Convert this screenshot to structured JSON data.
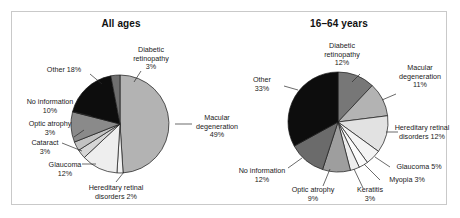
{
  "figure": {
    "border_color": "#c9c9c9",
    "background": "#ffffff"
  },
  "charts": [
    {
      "id": "all-ages",
      "title": "All ages",
      "center": [
        108,
        112
      ],
      "radius": 49,
      "start_angle": -90,
      "chart_data": {
        "type": "pie",
        "title": "All ages",
        "xlabel": "",
        "ylabel": "",
        "legend": "none",
        "grid": false,
        "categories": [
          "Macular degeneration",
          "Hereditary retinal disorders",
          "Glaucoma",
          "Cataract",
          "Optic atrophy",
          "No information",
          "Other",
          "Diabetic retinopathy"
        ],
        "values": [
          49,
          2,
          12,
          3,
          3,
          10,
          18,
          3
        ],
        "units": "percent",
        "colors": [
          "#b3b3b3",
          "#f2f2f2",
          "#eeeeee",
          "#d6d6d6",
          "#c2c2c2",
          "#8a8a8a",
          "#0d0d0d",
          "#6e6e6e"
        ],
        "labels": [
          {
            "text": "Macular",
            "text2": "degeneration",
            "text3": "49%",
            "x": 205,
            "y": 108,
            "anchor": "middle",
            "leader": [
              [
                163,
                112
              ],
              [
                180,
                112
              ]
            ]
          },
          {
            "text": "Hereditary retinal",
            "text2": "disorders 2%",
            "text3": "",
            "x": 104,
            "y": 178,
            "anchor": "middle",
            "leader": [
              [
                112,
                160
              ],
              [
                104,
                170
              ]
            ]
          },
          {
            "text": "Glaucoma",
            "text2": "12%",
            "text3": "",
            "x": 53,
            "y": 155,
            "anchor": "middle",
            "leader": [
              [
                84,
                152
              ],
              [
                70,
                152
              ]
            ]
          },
          {
            "text": "Cataract",
            "text2": "3%",
            "text3": "",
            "x": 33,
            "y": 133,
            "anchor": "middle",
            "leader": [
              [
                70,
                139
              ],
              [
                50,
                131
              ]
            ]
          },
          {
            "text": "Optic atrophy",
            "text2": "3%",
            "text3": "",
            "x": 38,
            "y": 114,
            "anchor": "middle",
            "leader": [
              [
                62,
                125
              ],
              [
                72,
                118
              ]
            ]
          },
          {
            "text": "No information",
            "text2": "10%",
            "text3": "",
            "x": 38,
            "y": 92,
            "anchor": "middle",
            "leader": [
              [
                62,
                100
              ],
              [
                79,
                104
              ]
            ]
          },
          {
            "text": "Other 18%",
            "text2": "",
            "text3": "",
            "x": 52,
            "y": 60,
            "anchor": "middle",
            "leader": [
              [
                78,
                62
              ],
              [
                90,
                72
              ]
            ]
          },
          {
            "text": "Diabetic",
            "text2": "retinopathy",
            "text3": "3%",
            "x": 139,
            "y": 40,
            "anchor": "middle",
            "leader": [
              [
                129,
                59
              ],
              [
                122,
                70
              ]
            ]
          }
        ]
      }
    },
    {
      "id": "16-64-years",
      "title": "16–64 years",
      "center": [
        108,
        110
      ],
      "radius": 50,
      "start_angle": -90,
      "chart_data": {
        "type": "pie",
        "title": "16–64 years",
        "xlabel": "",
        "ylabel": "",
        "legend": "none",
        "grid": false,
        "categories": [
          "Diabetic retinopathy",
          "Macular degeneration",
          "Hereditary retinal disorders",
          "Glaucoma",
          "Myopia",
          "Keratitis",
          "Optic atrophy",
          "No information",
          "Other"
        ],
        "values": [
          12,
          11,
          12,
          5,
          3,
          3,
          9,
          12,
          33
        ],
        "units": "percent",
        "colors": [
          "#777777",
          "#b3b3b3",
          "#e2e2e2",
          "#f4f4f4",
          "#fbfbfb",
          "#ededed",
          "#9e9e9e",
          "#6b6b6b",
          "#0d0d0d"
        ],
        "labels": [
          {
            "text": "Diabetic",
            "text2": "retinopathy",
            "text3": "12%",
            "x": 112,
            "y": 36,
            "anchor": "middle",
            "leader": [
              [
                130,
                62
              ],
              [
                122,
                70
              ]
            ]
          },
          {
            "text": "Macular",
            "text2": "degeneration",
            "text3": "11%",
            "x": 190,
            "y": 58,
            "anchor": "middle",
            "leader": [
              [
                152,
                88
              ],
              [
                166,
                82
              ]
            ]
          },
          {
            "text": "Hereditary retinal",
            "text2": "disorders 12%",
            "text3": "",
            "x": 192,
            "y": 118,
            "anchor": "middle",
            "leader": [
              [
                156,
                120
              ],
              [
                168,
                120
              ]
            ]
          },
          {
            "text": "Glaucoma 5%",
            "text2": "",
            "text3": "",
            "x": 189,
            "y": 157,
            "anchor": "middle",
            "leader": [
              [
                145,
                145
              ],
              [
                160,
                155
              ]
            ]
          },
          {
            "text": "Myopia 3%",
            "text2": "",
            "text3": "",
            "x": 177,
            "y": 170,
            "anchor": "middle",
            "leader": [
              [
                134,
                152
              ],
              [
                150,
                168
              ]
            ]
          },
          {
            "text": "Keratitis",
            "text2": "3%",
            "text3": "",
            "x": 140,
            "y": 180,
            "anchor": "middle",
            "leader": [
              [
                124,
                157
              ],
              [
                133,
                176
              ]
            ]
          },
          {
            "text": "Optic atrophy",
            "text2": "9%",
            "text3": "",
            "x": 83,
            "y": 180,
            "anchor": "middle",
            "leader": [
              [
                100,
                157
              ],
              [
                93,
                174
              ]
            ]
          },
          {
            "text": "No information",
            "text2": "12%",
            "text3": "",
            "x": 32,
            "y": 161,
            "anchor": "middle",
            "leader": [
              [
                72,
                146
              ],
              [
                58,
                156
              ]
            ]
          },
          {
            "text": "Other",
            "text2": "33%",
            "text3": "",
            "x": 32,
            "y": 70,
            "anchor": "middle",
            "leader": [
              [
                68,
                78
              ],
              [
                54,
                74
              ]
            ]
          }
        ]
      }
    }
  ]
}
